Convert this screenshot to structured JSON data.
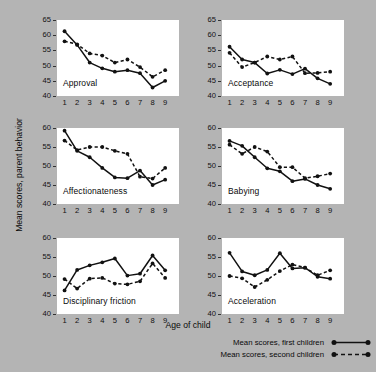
{
  "chart_data": {
    "type": "line",
    "title": "",
    "xlabel": "Age of child",
    "ylabel": "Mean scores, parent behavior",
    "x": [
      1,
      2,
      3,
      4,
      5,
      6,
      7,
      8,
      9
    ],
    "xtick_labels": [
      "1",
      "2",
      "3",
      "4",
      "5",
      "6",
      "7",
      "8",
      "9"
    ],
    "grid": false,
    "legend_position": "bottom-right",
    "series_names": [
      "Mean scores, first children",
      "Mean scores, second children"
    ],
    "panels": [
      {
        "name": "Approval",
        "ylim": [
          40,
          65
        ],
        "yticks": [
          40,
          45,
          50,
          55,
          60,
          65
        ],
        "ytick_labels": [
          "40",
          "45",
          "50",
          "55",
          "60",
          "65"
        ],
        "series": [
          {
            "name": "Mean scores, first children",
            "style": "solid",
            "values": [
              61.3,
              56.8,
              51.0,
              49.1,
              48.0,
              48.5,
              47.5,
              42.8,
              45.0
            ]
          },
          {
            "name": "Mean scores, second children",
            "style": "dashed",
            "values": [
              58.0,
              57.0,
              54.0,
              53.3,
              51.0,
              52.0,
              49.5,
              46.3,
              48.5
            ]
          }
        ]
      },
      {
        "name": "Acceptance",
        "ylim": [
          40,
          65
        ],
        "yticks": [
          40,
          45,
          50,
          55,
          60,
          65
        ],
        "ytick_labels": [
          "40",
          "45",
          "50",
          "55",
          "60",
          "65"
        ],
        "series": [
          {
            "name": "Mean scores, first children",
            "style": "solid",
            "values": [
              56.2,
              52.0,
              51.0,
              47.4,
              48.6,
              47.2,
              49.0,
              45.8,
              44.0
            ]
          },
          {
            "name": "Mean scores, second children",
            "style": "dashed",
            "values": [
              54.2,
              49.5,
              51.0,
              53.0,
              52.0,
              53.0,
              47.5,
              47.6,
              48.0
            ]
          }
        ]
      },
      {
        "name": "Affectionateness",
        "ylim": [
          40,
          60
        ],
        "yticks": [
          40,
          45,
          50,
          55,
          60
        ],
        "ytick_labels": [
          "40",
          "45",
          "50",
          "55",
          "60"
        ],
        "series": [
          {
            "name": "Mean scores, first children",
            "style": "solid",
            "values": [
              59.3,
              54.0,
              52.3,
              49.5,
              47.0,
              46.8,
              48.8,
              45.0,
              46.4
            ]
          },
          {
            "name": "Mean scores, second children",
            "style": "dashed",
            "values": [
              56.7,
              54.2,
              55.0,
              55.0,
              54.0,
              53.2,
              47.2,
              46.7,
              49.5
            ]
          }
        ]
      },
      {
        "name": "Babying",
        "ylim": [
          40,
          60
        ],
        "yticks": [
          40,
          45,
          50,
          55,
          60
        ],
        "ytick_labels": [
          "40",
          "45",
          "50",
          "55",
          "60"
        ],
        "series": [
          {
            "name": "Mean scores, first children",
            "style": "solid",
            "values": [
              56.6,
              55.3,
              52.3,
              49.4,
              48.6,
              46.0,
              46.6,
              45.0,
              44.0
            ]
          },
          {
            "name": "Mean scores, second children",
            "style": "dashed",
            "values": [
              55.6,
              53.2,
              55.0,
              53.8,
              49.7,
              49.7,
              46.8,
              47.3,
              48.0
            ]
          }
        ]
      },
      {
        "name": "Disciplinary friction",
        "ylim": [
          40,
          60
        ],
        "yticks": [
          40,
          45,
          50,
          55,
          60
        ],
        "ytick_labels": [
          "40",
          "45",
          "50",
          "55",
          "60"
        ],
        "series": [
          {
            "name": "Mean scores, first children",
            "style": "solid",
            "values": [
              46.2,
              51.6,
              52.8,
              53.6,
              54.6,
              50.1,
              50.6,
              55.4,
              51.5
            ]
          },
          {
            "name": "Mean scores, second children",
            "style": "dashed",
            "values": [
              49.2,
              46.7,
              49.3,
              49.5,
              48.0,
              47.8,
              48.6,
              53.3,
              49.5
            ]
          }
        ]
      },
      {
        "name": "Acceleration",
        "ylim": [
          40,
          60
        ],
        "yticks": [
          40,
          45,
          50,
          55,
          60
        ],
        "ytick_labels": [
          "40",
          "45",
          "50",
          "55",
          "60"
        ],
        "series": [
          {
            "name": "Mean scores, first children",
            "style": "solid",
            "values": [
              56.1,
              51.2,
              50.2,
              51.6,
              56.0,
              52.0,
              52.2,
              49.8,
              49.3
            ]
          },
          {
            "name": "Mean scores, second children",
            "style": "dashed",
            "values": [
              50.0,
              49.4,
              47.1,
              49.0,
              51.3,
              53.0,
              52.2,
              50.2,
              51.5
            ]
          }
        ]
      }
    ]
  },
  "axes": {
    "ylabel": "Mean scores, parent behavior",
    "xlabel": "Age of child"
  },
  "legend": {
    "entries": [
      {
        "label": "Mean scores, first children",
        "style": "solid"
      },
      {
        "label": "Mean scores, second children",
        "style": "dashed"
      }
    ]
  },
  "colors": {
    "background": "#b4b4b4",
    "panel": "#ffffff",
    "line": "#111111",
    "text": "#0a0a0a"
  }
}
